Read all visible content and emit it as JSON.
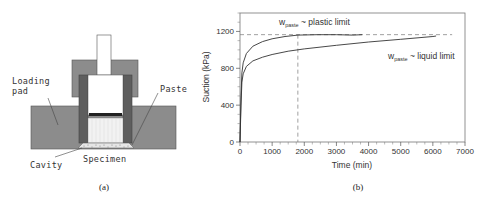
{
  "panel_a": {
    "caption": "(a)",
    "labels": {
      "loading_pad_line1": "Loading",
      "loading_pad_line2": "pad",
      "paste": "Paste",
      "cavity": "Cavity",
      "specimen": "Specimen"
    },
    "colors": {
      "body_fill": "#8c8c8c",
      "tube_fill": "#5e5e5e",
      "outline": "#444444",
      "specimen_fill": "#eeeeee"
    }
  },
  "panel_b": {
    "caption": "(b)"
  },
  "chart_data": {
    "type": "line",
    "title": "",
    "xlabel": "Time (min)",
    "ylabel": "Suction (kPa)",
    "xlim": [
      0,
      7000
    ],
    "ylim": [
      0,
      1400
    ],
    "x_ticks": [
      0,
      1000,
      2000,
      3000,
      4000,
      5000,
      6000,
      7000
    ],
    "y_ticks": [
      0,
      400,
      800,
      1200
    ],
    "x_tick_labels": [
      "0",
      "1000",
      "2000",
      "3000",
      "4000",
      "5000",
      "6000",
      "7000"
    ],
    "y_tick_labels": [
      "0",
      "400",
      "800",
      "1200"
    ],
    "grid": false,
    "legend": "none (inline annotations)",
    "series": [
      {
        "name": "w_paste ~ plastic limit",
        "annotation_main": "w",
        "annotation_sub": "paste",
        "annotation_rest": " ~ plastic limit",
        "x": [
          0,
          30,
          60,
          100,
          200,
          400,
          700,
          1000,
          1400,
          1800,
          2400,
          3000,
          3500,
          3800
        ],
        "y": [
          0,
          500,
          750,
          860,
          960,
          1040,
          1090,
          1120,
          1145,
          1160,
          1165,
          1165,
          1160,
          1165
        ]
      },
      {
        "name": "w_paste ~ liquid limit",
        "annotation_main": "w",
        "annotation_sub": "paste",
        "annotation_rest": " ~ liquid limit",
        "x": [
          0,
          30,
          60,
          100,
          200,
          400,
          700,
          1000,
          1500,
          2000,
          3000,
          4000,
          5000,
          6000,
          6100
        ],
        "y": [
          0,
          400,
          650,
          740,
          820,
          880,
          920,
          950,
          985,
          1010,
          1050,
          1085,
          1115,
          1145,
          1150
        ]
      }
    ],
    "reference_lines": [
      {
        "orientation": "horizontal",
        "value": 1165,
        "style": "dashed",
        "x_range": [
          0,
          6600
        ]
      },
      {
        "orientation": "vertical",
        "value": 1800,
        "style": "dashed"
      }
    ]
  }
}
